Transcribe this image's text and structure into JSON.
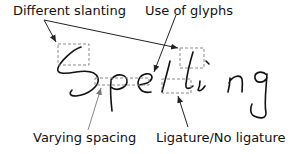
{
  "figure": {
    "word": "Spelling",
    "annotations": [
      {
        "id": "slanting",
        "label": "Different slanting"
      },
      {
        "id": "glyphs",
        "label": "Use of glyphs"
      },
      {
        "id": "spacing",
        "label": "Varying spacing"
      },
      {
        "id": "ligature",
        "label": "Ligature/No ligature"
      }
    ]
  },
  "colors": {
    "ink": "#111111",
    "box": "#8a8a8a",
    "arrow": "#333333",
    "spacing_arrow": "#999999"
  }
}
